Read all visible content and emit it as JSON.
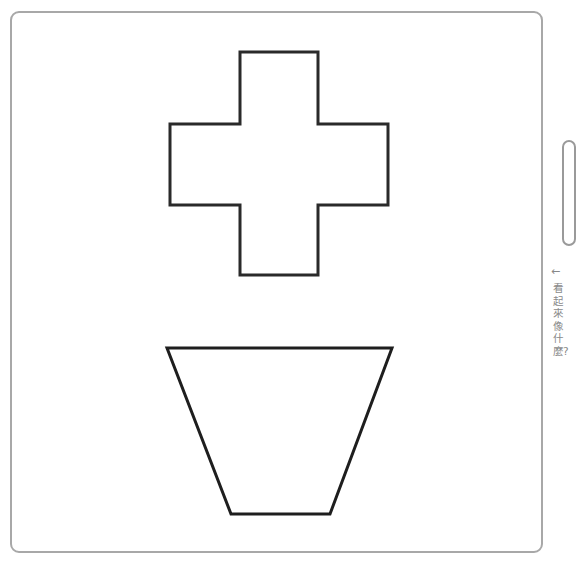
{
  "figure": {
    "frame": {
      "border_color": "#a8a8a8"
    },
    "shapes": [
      {
        "name": "cross",
        "type": "polygon",
        "stroke": "#2a2a2a",
        "points": "240,52 318,52 318,124 388,124 388,205 318,205 318,275 240,275 240,205 170,205 170,124 240,124"
      },
      {
        "name": "trapezoid",
        "type": "polygon",
        "stroke": "#1e1e1e",
        "points": "167,348 392,348 330,514 231,514"
      }
    ]
  },
  "side_panel": {
    "arrow": "←",
    "caption": "看起來像什麼?"
  }
}
